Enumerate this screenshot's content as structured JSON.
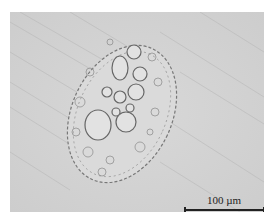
{
  "image": {
    "description": "Bright-field micrograph of an oval porous cellular particle on a grey background with diagonal streaks",
    "background_color": "#d4d4d4",
    "border_color": "#ffffff"
  },
  "scale_bar": {
    "label": "100 µm",
    "value": 100,
    "unit": "µm"
  }
}
